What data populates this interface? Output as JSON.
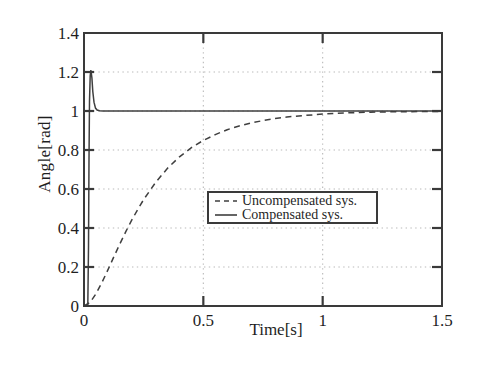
{
  "figure": {
    "background": "#ffffff"
  },
  "colors": {
    "axis": "#3a3a3a",
    "line": "#3f3f3f",
    "grid": "#b9b9b9",
    "text": "#1f1f1f",
    "legend_border": "#3a3a3a"
  },
  "chart_data": {
    "type": "line",
    "title": "",
    "xlabel": "Time[s]",
    "ylabel": "Angle[rad]",
    "xlim": [
      0,
      1.5
    ],
    "ylim": [
      0,
      1.4
    ],
    "grid_on": true,
    "grid_style": "dotted",
    "xticks": {
      "values": [
        0,
        0.5,
        1,
        1.5
      ],
      "labels": [
        "0",
        "0.5",
        "1",
        "1.5"
      ]
    },
    "yticks": {
      "values": [
        0,
        0.2,
        0.4,
        0.6,
        0.8,
        1,
        1.2,
        1.4
      ],
      "labels": [
        "0",
        "0.2",
        "0.4",
        "0.6",
        "0.8",
        "1",
        "1.2",
        "1.4"
      ]
    },
    "gridlines": {
      "x": [
        0.5,
        1
      ],
      "y": [
        0.2,
        0.4,
        0.6,
        0.8,
        1,
        1.2
      ]
    },
    "legend": {
      "position": "center",
      "entries": [
        {
          "label": "Uncompensated sys.",
          "style": "dashed"
        },
        {
          "label": "Compensated sys.",
          "style": "solid"
        }
      ]
    },
    "series": [
      {
        "name": "Uncompensated sys.",
        "style": "dashed",
        "points": [
          [
            0,
            0
          ],
          [
            0.025,
            0.018
          ],
          [
            0.05,
            0.062
          ],
          [
            0.075,
            0.12
          ],
          [
            0.1,
            0.185
          ],
          [
            0.125,
            0.252
          ],
          [
            0.15,
            0.318
          ],
          [
            0.175,
            0.381
          ],
          [
            0.2,
            0.44
          ],
          [
            0.225,
            0.495
          ],
          [
            0.25,
            0.546
          ],
          [
            0.3,
            0.634
          ],
          [
            0.35,
            0.706
          ],
          [
            0.4,
            0.765
          ],
          [
            0.45,
            0.812
          ],
          [
            0.5,
            0.849
          ],
          [
            0.55,
            0.879
          ],
          [
            0.6,
            0.904
          ],
          [
            0.65,
            0.923
          ],
          [
            0.7,
            0.939
          ],
          [
            0.75,
            0.951
          ],
          [
            0.8,
            0.961
          ],
          [
            0.85,
            0.969
          ],
          [
            0.9,
            0.975
          ],
          [
            1.0,
            0.984
          ],
          [
            1.1,
            0.99
          ],
          [
            1.2,
            0.994
          ],
          [
            1.3,
            0.996
          ],
          [
            1.4,
            0.997
          ],
          [
            1.5,
            0.998
          ]
        ]
      },
      {
        "name": "Compensated sys.",
        "style": "solid",
        "points": [
          [
            0,
            0
          ],
          [
            0.016,
            0
          ],
          [
            0.019,
            0.3
          ],
          [
            0.021,
            0.75
          ],
          [
            0.023,
            1.05
          ],
          [
            0.026,
            1.18
          ],
          [
            0.029,
            1.21
          ],
          [
            0.033,
            1.17
          ],
          [
            0.037,
            1.1
          ],
          [
            0.042,
            1.045
          ],
          [
            0.048,
            1.015
          ],
          [
            0.055,
            1.005
          ],
          [
            0.065,
            1.001
          ],
          [
            0.08,
            1
          ],
          [
            0.2,
            1
          ],
          [
            0.5,
            1
          ],
          [
            1,
            1
          ],
          [
            1.5,
            1
          ]
        ]
      }
    ]
  }
}
